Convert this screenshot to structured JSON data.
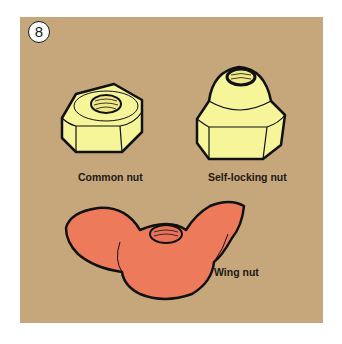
{
  "figure": {
    "number": "8",
    "background_color": "#c6a77c",
    "items": [
      {
        "label": "Common nut",
        "color": "#f6f59a"
      },
      {
        "label": "Self-locking nut",
        "color": "#f6f59a"
      },
      {
        "label": "Wing nut",
        "color": "#ee7a5c"
      }
    ]
  }
}
